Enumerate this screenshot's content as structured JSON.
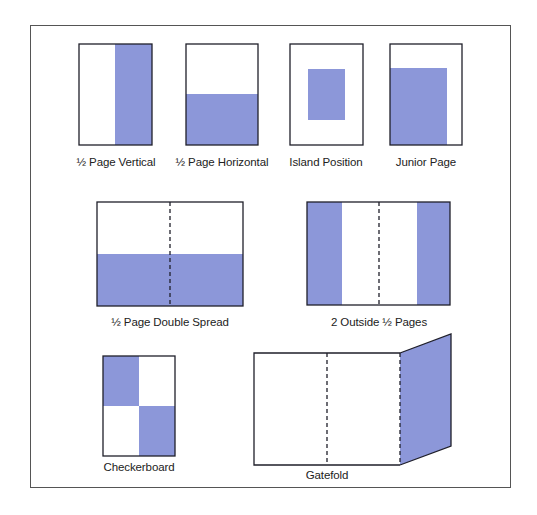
{
  "diagram": {
    "title": "",
    "colors": {
      "fill": "#8c97d9",
      "stroke": "#1f1f2a",
      "frame": "#555555",
      "background": "#ffffff"
    },
    "layouts": [
      {
        "id": "half-page-vertical",
        "label": "½ Page Vertical",
        "shape": "page",
        "fill": "right half"
      },
      {
        "id": "half-page-horizontal",
        "label": "½ Page Horizontal",
        "shape": "page",
        "fill": "bottom half"
      },
      {
        "id": "island-position",
        "label": "Island Position",
        "shape": "page",
        "fill": "centered island"
      },
      {
        "id": "junior-page",
        "label": "Junior Page",
        "shape": "page",
        "fill": "bottom-left large block"
      },
      {
        "id": "half-page-double-spread",
        "label": "½ Page Double Spread",
        "shape": "spread",
        "fill": "bottom half across both pages"
      },
      {
        "id": "two-outside-half-pages",
        "label": "2 Outside ½ Pages",
        "shape": "spread",
        "fill": "outer vertical strips"
      },
      {
        "id": "checkerboard",
        "label": "Checkerboard",
        "shape": "page",
        "fill": "top-left and bottom-right quadrants"
      },
      {
        "id": "gatefold",
        "label": "Gatefold",
        "shape": "gatefold",
        "fill": "folded-out panel"
      }
    ]
  }
}
